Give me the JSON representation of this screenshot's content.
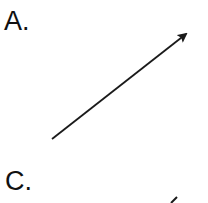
{
  "panels": [
    {
      "label": "A.",
      "arrow": {
        "x1": 52,
        "y1": 139,
        "x2": 188,
        "y2": 33,
        "color": "#1a1a1a"
      }
    },
    {
      "label": "C.",
      "arrow": {
        "partial": true,
        "color": "#1a1a1a"
      }
    }
  ]
}
